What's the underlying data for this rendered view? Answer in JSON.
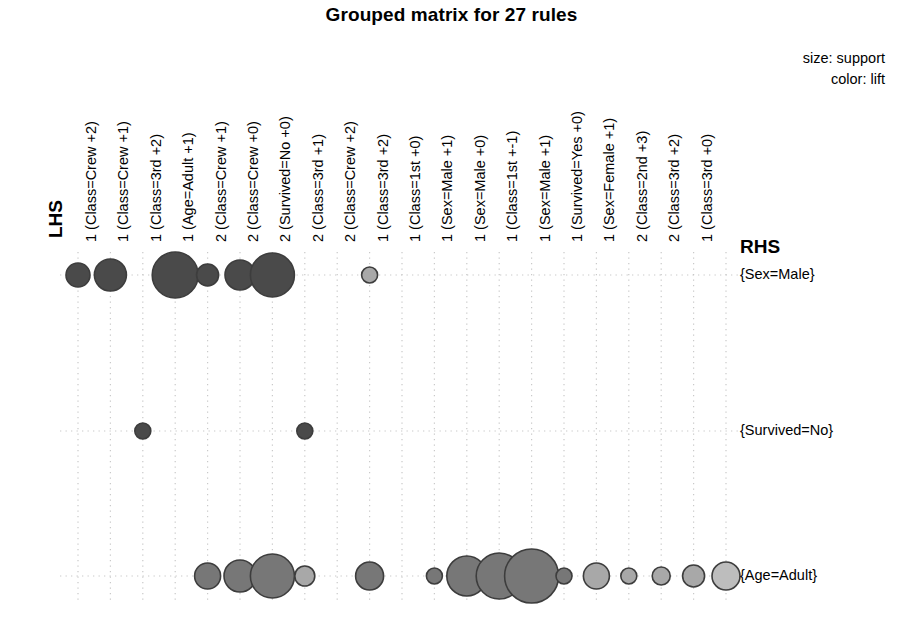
{
  "title": "Grouped matrix for 27 rules",
  "legend": {
    "size_text": "size: support",
    "color_text": "color: lift"
  },
  "axis_titles": {
    "lhs": "LHS",
    "rhs": "RHS"
  },
  "colors": {
    "background": "#ffffff",
    "text": "#000000",
    "grid": "#c9c9c9",
    "bubble_stroke": "#3d3d3d",
    "lift_high": "#4a4a4a",
    "lift_mid": "#777777",
    "lift_low": "#a8a8a8",
    "lift_lowest": "#bdbdbd"
  },
  "chart_data": {
    "type": "scatter",
    "title": "Grouped matrix for 27 rules",
    "xlabel": "LHS",
    "ylabel": "RHS",
    "grid": true,
    "legend_position": "top-right",
    "size_encodes": "support",
    "color_encodes": "lift",
    "n_rules": 27,
    "categories": [
      "1 (Class=Crew +2)",
      "1 (Class=Crew +1)",
      "1 (Class=3rd +2)",
      "1 (Age=Adult +1)",
      "2 (Class=Crew +1)",
      "2 (Class=Crew +0)",
      "2 (Survived=No +0)",
      "2 (Class=3rd +1)",
      "2 (Class=Crew +2)",
      "1 (Class=3rd +2)",
      "1 (Class=1st +0)",
      "1 (Sex=Male +1)",
      "1 (Sex=Male +0)",
      "1 (Class=1st +-1)",
      "1 (Sex=Male +1)",
      "1 (Survived=Yes +0)",
      "1 (Sex=Female +1)",
      "2 (Class=2nd +3)",
      "2 (Class=3rd +2)",
      "1 (Class=3rd +0)"
    ],
    "rows": [
      "{Sex=Male}",
      "{Survived=No}",
      "{Age=Adult}"
    ],
    "points": [
      {
        "row": 0,
        "col": 0,
        "size": 12,
        "lift": "high"
      },
      {
        "row": 0,
        "col": 1,
        "size": 16,
        "lift": "high"
      },
      {
        "row": 0,
        "col": 3,
        "size": 23,
        "lift": "high"
      },
      {
        "row": 0,
        "col": 4,
        "size": 11,
        "lift": "high"
      },
      {
        "row": 0,
        "col": 5,
        "size": 15,
        "lift": "high"
      },
      {
        "row": 0,
        "col": 6,
        "size": 22,
        "lift": "high"
      },
      {
        "row": 0,
        "col": 9,
        "size": 8,
        "lift": "low"
      },
      {
        "row": 1,
        "col": 2,
        "size": 8,
        "lift": "high"
      },
      {
        "row": 1,
        "col": 7,
        "size": 8,
        "lift": "high"
      },
      {
        "row": 2,
        "col": 4,
        "size": 13,
        "lift": "mid"
      },
      {
        "row": 2,
        "col": 5,
        "size": 16,
        "lift": "mid"
      },
      {
        "row": 2,
        "col": 6,
        "size": 22,
        "lift": "mid"
      },
      {
        "row": 2,
        "col": 7,
        "size": 10,
        "lift": "low"
      },
      {
        "row": 2,
        "col": 9,
        "size": 14,
        "lift": "mid"
      },
      {
        "row": 2,
        "col": 11,
        "size": 8,
        "lift": "mid"
      },
      {
        "row": 2,
        "col": 12,
        "size": 20,
        "lift": "mid"
      },
      {
        "row": 2,
        "col": 13,
        "size": 23,
        "lift": "mid"
      },
      {
        "row": 2,
        "col": 14,
        "size": 27,
        "lift": "mid"
      },
      {
        "row": 2,
        "col": 15,
        "size": 8,
        "lift": "mid"
      },
      {
        "row": 2,
        "col": 16,
        "size": 13,
        "lift": "low"
      },
      {
        "row": 2,
        "col": 17,
        "size": 8,
        "lift": "low"
      },
      {
        "row": 2,
        "col": 18,
        "size": 9,
        "lift": "low"
      },
      {
        "row": 2,
        "col": 19,
        "size": 11,
        "lift": "low"
      },
      {
        "row": 2,
        "col": 20,
        "size": 14,
        "lift": "lowest"
      }
    ]
  },
  "geometry": {
    "col_x0": 78,
    "col_dx": 32.4,
    "n_cols": 21,
    "row_y": [
      275,
      431,
      576
    ],
    "grid_top": 252,
    "grid_bottom": 600
  }
}
